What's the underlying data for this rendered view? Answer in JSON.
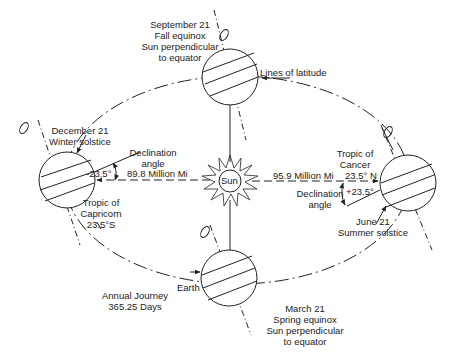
{
  "sun": {
    "label": "Sun"
  },
  "positions": {
    "september": {
      "line1": "September 21",
      "line2": "Fall equinox",
      "line3": "Sun perpendicular",
      "line4": "to equator"
    },
    "december": {
      "line1": "December 21",
      "line2": "Winter solstice"
    },
    "june": {
      "line1": "June 21",
      "line2": "Summer solstice"
    },
    "march": {
      "line1": "March 21",
      "line2": "Spring equinox",
      "line3": "Sun perpendicular",
      "line4": "to equator"
    }
  },
  "labels": {
    "lines_of_latitude": "Lines of latitude",
    "declination_left_1": "Declination",
    "declination_left_2": "angle",
    "declination_left_value": "-23.5°",
    "distance_left": "89.8 Million Mi",
    "tropic_capricorn_1": "Tropic of",
    "tropic_capricorn_2": "Capricorn",
    "tropic_capricorn_3": "23.5°S",
    "distance_right": "95.9 Million Mi",
    "tropic_cancer_1": "Tropic of",
    "tropic_cancer_2": "Cancer",
    "tropic_cancer_3": "23.5°  N",
    "declination_right_value": "+23.5°",
    "declination_right_1": "Declination",
    "declination_right_2": "angle",
    "earth": "Earth",
    "annual_1": "Annual Journey",
    "annual_2": "365.25 Days"
  }
}
